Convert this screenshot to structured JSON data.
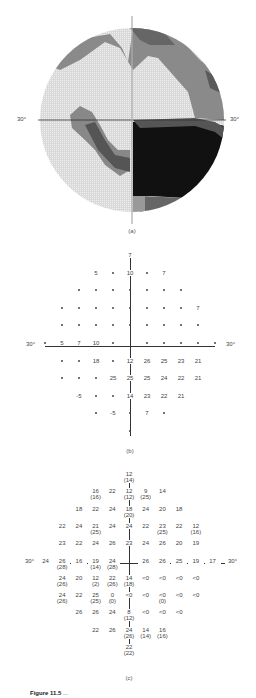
{
  "panel_a": {
    "caption": "(a)",
    "left_label": "30°",
    "right_label": "30°"
  },
  "panel_b": {
    "caption": "(b)",
    "left_label": "30°",
    "right_label": "30°",
    "rows": [
      [
        {
          "x": 0,
          "v": "7"
        }
      ],
      [
        {
          "x": -2,
          "v": "5"
        },
        {
          "x": -1,
          "v": "•"
        },
        {
          "x": 0,
          "v": "10"
        },
        {
          "x": 1,
          "v": "•"
        },
        {
          "x": 2,
          "v": "7"
        }
      ],
      [
        {
          "x": -3,
          "v": "•"
        },
        {
          "x": -2,
          "v": "•"
        },
        {
          "x": -1,
          "v": "•"
        },
        {
          "x": 0,
          "v": "•"
        },
        {
          "x": 1,
          "v": "•"
        },
        {
          "x": 2,
          "v": "•"
        },
        {
          "x": 3,
          "v": "•"
        }
      ],
      [
        {
          "x": -4,
          "v": "•"
        },
        {
          "x": -3,
          "v": "•"
        },
        {
          "x": -2,
          "v": "•"
        },
        {
          "x": -1,
          "v": "•"
        },
        {
          "x": 0,
          "v": "•"
        },
        {
          "x": 1,
          "v": "•"
        },
        {
          "x": 2,
          "v": "•"
        },
        {
          "x": 3,
          "v": "•"
        },
        {
          "x": 4,
          "v": "7"
        }
      ],
      [
        {
          "x": -4,
          "v": "•"
        },
        {
          "x": -3,
          "v": "•"
        },
        {
          "x": -2,
          "v": "•"
        },
        {
          "x": -1,
          "v": "•"
        },
        {
          "x": 0,
          "v": "•"
        },
        {
          "x": 1,
          "v": "•"
        },
        {
          "x": 2,
          "v": "•"
        },
        {
          "x": 3,
          "v": "•"
        },
        {
          "x": 4,
          "v": "•"
        }
      ],
      [
        {
          "x": -5,
          "v": "•"
        },
        {
          "x": -4,
          "v": "5"
        },
        {
          "x": -3,
          "v": "7"
        },
        {
          "x": -2,
          "v": "10"
        },
        {
          "x": -1,
          "v": "•"
        },
        {
          "x": 1,
          "v": "•"
        },
        {
          "x": 2,
          "v": "•"
        },
        {
          "x": 3,
          "v": "•"
        },
        {
          "x": 4,
          "v": "•"
        },
        {
          "x": 5,
          "v": "•"
        }
      ],
      [
        {
          "x": -4,
          "v": "•"
        },
        {
          "x": -3,
          "v": "•"
        },
        {
          "x": -2,
          "v": "18"
        },
        {
          "x": -1,
          "v": "•"
        },
        {
          "x": 0,
          "v": "12"
        },
        {
          "x": 1,
          "v": "26"
        },
        {
          "x": 2,
          "v": "25"
        },
        {
          "x": 3,
          "v": "23"
        },
        {
          "x": 4,
          "v": "21"
        }
      ],
      [
        {
          "x": -4,
          "v": "•"
        },
        {
          "x": -3,
          "v": "•"
        },
        {
          "x": -2,
          "v": "•"
        },
        {
          "x": -1,
          "v": "25"
        },
        {
          "x": 0,
          "v": "25"
        },
        {
          "x": 1,
          "v": "25"
        },
        {
          "x": 2,
          "v": "24"
        },
        {
          "x": 3,
          "v": "22"
        },
        {
          "x": 4,
          "v": "21"
        }
      ],
      [
        {
          "x": -3,
          "v": "-5"
        },
        {
          "x": -2,
          "v": "•"
        },
        {
          "x": -1,
          "v": "•"
        },
        {
          "x": 0,
          "v": "14"
        },
        {
          "x": 1,
          "v": "23"
        },
        {
          "x": 2,
          "v": "22"
        },
        {
          "x": 3,
          "v": "21"
        }
      ],
      [
        {
          "x": -2,
          "v": "•"
        },
        {
          "x": -1,
          "v": "-5"
        },
        {
          "x": 0,
          "v": "•"
        },
        {
          "x": 1,
          "v": "7"
        },
        {
          "x": 2,
          "v": "•"
        }
      ],
      [
        {
          "x": 0,
          "v": "•"
        }
      ]
    ]
  },
  "panel_c": {
    "caption": "(c)",
    "left_label": "30°",
    "right_label": "30°",
    "rows": [
      [
        {
          "x": 0,
          "v": "12",
          "s": "(14)"
        }
      ],
      [
        {
          "x": -2,
          "v": "16",
          "s": "(16)"
        },
        {
          "x": -1,
          "v": "22"
        },
        {
          "x": 0,
          "v": "12",
          "s": "(12)"
        },
        {
          "x": 1,
          "v": "9",
          "s": "(25)"
        },
        {
          "x": 2,
          "v": "14"
        }
      ],
      [
        {
          "x": -3,
          "v": "18"
        },
        {
          "x": -2,
          "v": "22"
        },
        {
          "x": -1,
          "v": "24"
        },
        {
          "x": 0,
          "v": "18",
          "s": "(20)"
        },
        {
          "x": 1,
          "v": "24"
        },
        {
          "x": 2,
          "v": "20"
        },
        {
          "x": 3,
          "v": "18"
        }
      ],
      [
        {
          "x": -4,
          "v": "22"
        },
        {
          "x": -3,
          "v": "24"
        },
        {
          "x": -2,
          "v": "21",
          "s": "(25)"
        },
        {
          "x": -1,
          "v": "24"
        },
        {
          "x": 0,
          "v": "24"
        },
        {
          "x": 1,
          "v": "22"
        },
        {
          "x": 2,
          "v": "23",
          "s": "(25)"
        },
        {
          "x": 3,
          "v": "22"
        },
        {
          "x": 4,
          "v": "12",
          "s": "(16)"
        }
      ],
      [
        {
          "x": -4,
          "v": "23"
        },
        {
          "x": -3,
          "v": "22"
        },
        {
          "x": -2,
          "v": "24"
        },
        {
          "x": -1,
          "v": "26"
        },
        {
          "x": 0,
          "v": "23"
        },
        {
          "x": 1,
          "v": "24"
        },
        {
          "x": 2,
          "v": "26"
        },
        {
          "x": 3,
          "v": "20"
        },
        {
          "x": 4,
          "v": "19"
        }
      ],
      [
        {
          "x": -5,
          "v": "24"
        },
        {
          "x": -4,
          "v": "26",
          "s": "(28)"
        },
        {
          "x": -3,
          "v": "16"
        },
        {
          "x": -2,
          "v": "19",
          "s": "(14)"
        },
        {
          "x": -1,
          "v": "24",
          "s": "(28)"
        },
        {
          "x": 1,
          "v": "26"
        },
        {
          "x": 2,
          "v": "26"
        },
        {
          "x": 3,
          "v": "25"
        },
        {
          "x": 4,
          "v": "19"
        },
        {
          "x": 5,
          "v": "17"
        }
      ],
      [
        {
          "x": -4,
          "v": "24",
          "s": "(26)"
        },
        {
          "x": -3,
          "v": "20"
        },
        {
          "x": -2,
          "v": "12",
          "s": "(2)"
        },
        {
          "x": -1,
          "v": "22",
          "s": "(26)"
        },
        {
          "x": 0,
          "v": "14",
          "s": "(18)"
        },
        {
          "x": 1,
          "v": "<0"
        },
        {
          "x": 2,
          "v": "<0"
        },
        {
          "x": 3,
          "v": "<0"
        },
        {
          "x": 4,
          "v": "<0"
        }
      ],
      [
        {
          "x": -4,
          "v": "24",
          "s": "(26)"
        },
        {
          "x": -3,
          "v": "22"
        },
        {
          "x": -2,
          "v": "25",
          "s": "(25)"
        },
        {
          "x": -1,
          "v": "0",
          "s": "(0)"
        },
        {
          "x": 0,
          "v": "<0"
        },
        {
          "x": 1,
          "v": "<0"
        },
        {
          "x": 2,
          "v": "<0",
          "s": "(0)"
        },
        {
          "x": 3,
          "v": "<0"
        },
        {
          "x": 4,
          "v": "<0"
        }
      ],
      [
        {
          "x": -3,
          "v": "26"
        },
        {
          "x": -2,
          "v": "26"
        },
        {
          "x": -1,
          "v": "24"
        },
        {
          "x": 0,
          "v": "8",
          "s": "(12)"
        },
        {
          "x": 1,
          "v": "<0"
        },
        {
          "x": 2,
          "v": "<0"
        },
        {
          "x": 3,
          "v": "<0"
        }
      ],
      [
        {
          "x": -2,
          "v": "22"
        },
        {
          "x": -1,
          "v": "26"
        },
        {
          "x": 0,
          "v": "24",
          "s": "(26)"
        },
        {
          "x": 1,
          "v": "14",
          "s": "(14)"
        },
        {
          "x": 2,
          "v": "16",
          "s": "(16)"
        }
      ],
      [
        {
          "x": 0,
          "v": "22",
          "s": "(22)"
        }
      ]
    ]
  },
  "figure_caption": {
    "label": "Figure 11.5",
    "text": "..."
  }
}
